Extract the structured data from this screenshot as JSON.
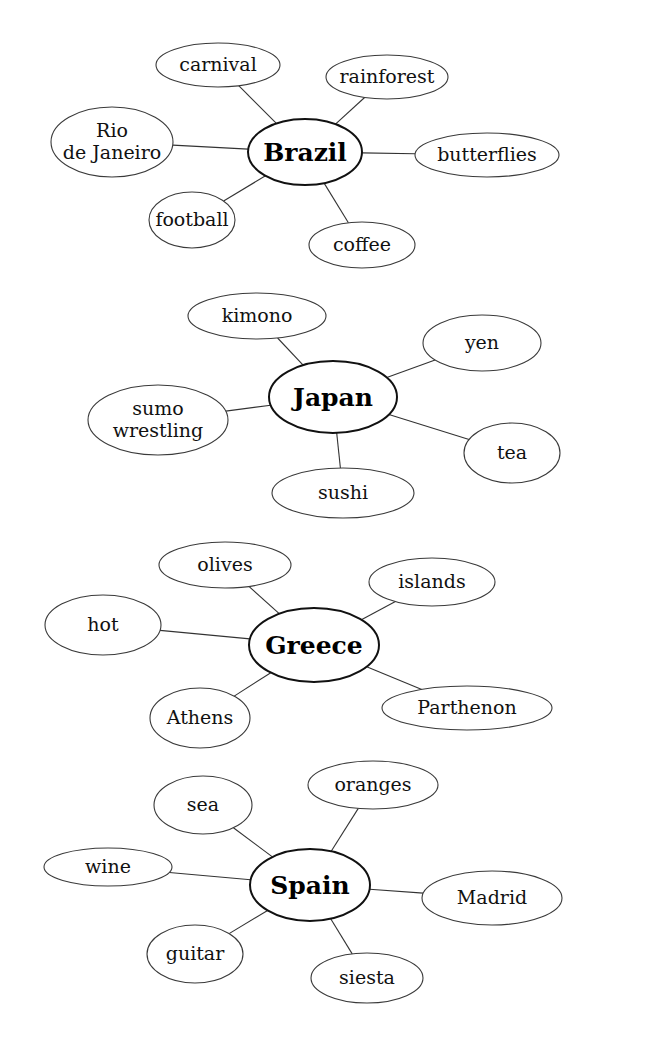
{
  "maps": [
    {
      "center": {
        "label": "Brazil",
        "cx": 305,
        "cy": 152,
        "rx": 57,
        "ry": 33
      },
      "nodes": [
        {
          "lines": [
            "carnival"
          ],
          "cx": 218,
          "cy": 65,
          "rx": 62,
          "ry": 22
        },
        {
          "lines": [
            "rainforest"
          ],
          "cx": 387,
          "cy": 77,
          "rx": 61,
          "ry": 22
        },
        {
          "lines": [
            "Rio",
            "de Janeiro"
          ],
          "cx": 112,
          "cy": 142,
          "rx": 61,
          "ry": 35
        },
        {
          "lines": [
            "butterflies"
          ],
          "cx": 487,
          "cy": 155,
          "rx": 72,
          "ry": 22
        },
        {
          "lines": [
            "football"
          ],
          "cx": 192,
          "cy": 220,
          "rx": 43,
          "ry": 28
        },
        {
          "lines": [
            "coffee"
          ],
          "cx": 362,
          "cy": 245,
          "rx": 53,
          "ry": 23
        }
      ]
    },
    {
      "center": {
        "label": "Japan",
        "cx": 333,
        "cy": 397,
        "rx": 64,
        "ry": 36
      },
      "nodes": [
        {
          "lines": [
            "kimono"
          ],
          "cx": 257,
          "cy": 316,
          "rx": 69,
          "ry": 23
        },
        {
          "lines": [
            "yen"
          ],
          "cx": 482,
          "cy": 343,
          "rx": 59,
          "ry": 28
        },
        {
          "lines": [
            "sumo",
            "wrestling"
          ],
          "cx": 158,
          "cy": 420,
          "rx": 70,
          "ry": 35
        },
        {
          "lines": [
            "tea"
          ],
          "cx": 512,
          "cy": 453,
          "rx": 48,
          "ry": 30
        },
        {
          "lines": [
            "sushi"
          ],
          "cx": 343,
          "cy": 493,
          "rx": 71,
          "ry": 25
        }
      ]
    },
    {
      "center": {
        "label": "Greece",
        "cx": 314,
        "cy": 645,
        "rx": 65,
        "ry": 37
      },
      "nodes": [
        {
          "lines": [
            "olives"
          ],
          "cx": 225,
          "cy": 565,
          "rx": 66,
          "ry": 23
        },
        {
          "lines": [
            "islands"
          ],
          "cx": 432,
          "cy": 582,
          "rx": 63,
          "ry": 24
        },
        {
          "lines": [
            "hot"
          ],
          "cx": 103,
          "cy": 625,
          "rx": 58,
          "ry": 30
        },
        {
          "lines": [
            "Athens"
          ],
          "cx": 200,
          "cy": 718,
          "rx": 50,
          "ry": 30
        },
        {
          "lines": [
            "Parthenon"
          ],
          "cx": 467,
          "cy": 708,
          "rx": 85,
          "ry": 22
        }
      ]
    },
    {
      "center": {
        "label": "Spain",
        "cx": 310,
        "cy": 885,
        "rx": 60,
        "ry": 36
      },
      "nodes": [
        {
          "lines": [
            "sea"
          ],
          "cx": 203,
          "cy": 805,
          "rx": 49,
          "ry": 29
        },
        {
          "lines": [
            "oranges"
          ],
          "cx": 373,
          "cy": 785,
          "rx": 65,
          "ry": 24
        },
        {
          "lines": [
            "wine"
          ],
          "cx": 108,
          "cy": 867,
          "rx": 64,
          "ry": 19
        },
        {
          "lines": [
            "Madrid"
          ],
          "cx": 492,
          "cy": 898,
          "rx": 70,
          "ry": 27
        },
        {
          "lines": [
            "guitar"
          ],
          "cx": 195,
          "cy": 954,
          "rx": 48,
          "ry": 29
        },
        {
          "lines": [
            "siesta"
          ],
          "cx": 367,
          "cy": 978,
          "rx": 56,
          "ry": 25
        }
      ]
    }
  ]
}
